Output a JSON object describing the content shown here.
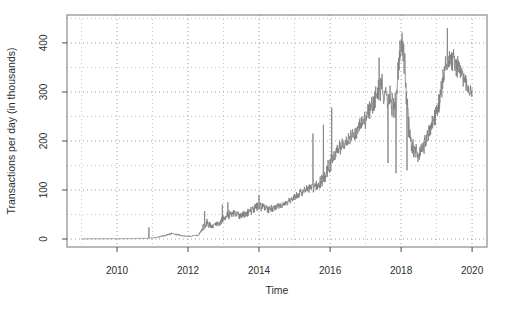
{
  "figure": {
    "background": "#ffffff"
  },
  "chart_data": {
    "type": "line",
    "title": "",
    "xlabel": "Time",
    "ylabel": "Transactions per day (in thousands)",
    "grid": true,
    "grid_style": "dotted",
    "legend": false,
    "xlim": [
      2008.592,
      2020.42
    ],
    "ylim": [
      -16.3,
      457
    ],
    "x_ticks": [
      2010,
      2012,
      2014,
      2016,
      2018,
      2020
    ],
    "y_ticks": [
      0,
      100,
      200,
      300,
      400
    ],
    "x_gridlines": [
      2009,
      2010,
      2011,
      2012,
      2013,
      2014,
      2015,
      2016,
      2017,
      2018,
      2019,
      2020
    ],
    "y_gridlines": [
      0,
      50,
      100,
      150,
      200,
      250,
      300,
      350,
      400,
      450
    ],
    "colors": {
      "series_line": "#7d7d7d",
      "plot_box": "#8a8a8a",
      "grid_major": "#9e9e9e",
      "grid_minor": "#c6c6c6",
      "tick": "#4a4a4a",
      "text": "#2e2e2e",
      "background": "#ffffff"
    },
    "series": [
      {
        "name": "transactions-per-day",
        "color": "#7d7d7d",
        "unit": "thousands of transactions per day",
        "x_start": 2009.0,
        "x_end": 2020.0,
        "trend": [
          [
            2009.0,
            0.3,
            0.2
          ],
          [
            2009.5,
            0.5,
            0.25
          ],
          [
            2010.0,
            0.6,
            0.3
          ],
          [
            2010.5,
            0.9,
            0.4
          ],
          [
            2010.88,
            1.6,
            0.7
          ],
          [
            2011.1,
            3.0,
            1.0
          ],
          [
            2011.35,
            7.0,
            2.0
          ],
          [
            2011.55,
            11.0,
            2.5
          ],
          [
            2011.8,
            7.0,
            1.8
          ],
          [
            2012.0,
            5.0,
            1.2
          ],
          [
            2012.3,
            7.5,
            1.8
          ],
          [
            2012.4,
            24.0,
            8.0
          ],
          [
            2012.55,
            33.0,
            9.0
          ],
          [
            2012.7,
            27.0,
            6.0
          ],
          [
            2012.9,
            33.0,
            7.0
          ],
          [
            2013.1,
            48.0,
            10.0
          ],
          [
            2013.3,
            52.0,
            9.0
          ],
          [
            2013.5,
            48.0,
            8.0
          ],
          [
            2013.75,
            57.0,
            9.0
          ],
          [
            2014.0,
            68.0,
            10.0
          ],
          [
            2014.25,
            60.0,
            8.0
          ],
          [
            2014.5,
            65.0,
            7.0
          ],
          [
            2014.75,
            74.0,
            7.0
          ],
          [
            2015.0,
            84.0,
            8.0
          ],
          [
            2015.25,
            98.0,
            9.0
          ],
          [
            2015.5,
            105.0,
            11.0
          ],
          [
            2015.75,
            118.0,
            13.0
          ],
          [
            2016.0,
            150.0,
            20.0
          ],
          [
            2016.25,
            185.0,
            16.0
          ],
          [
            2016.5,
            205.0,
            15.0
          ],
          [
            2016.75,
            220.0,
            16.0
          ],
          [
            2017.0,
            245.0,
            20.0
          ],
          [
            2017.25,
            285.0,
            24.0
          ],
          [
            2017.45,
            310.0,
            28.0
          ],
          [
            2017.65,
            290.0,
            30.0
          ],
          [
            2017.85,
            268.0,
            38.0
          ],
          [
            2017.97,
            380.0,
            45.0
          ],
          [
            2018.02,
            400.0,
            50.0
          ],
          [
            2018.08,
            385.0,
            45.0
          ],
          [
            2018.18,
            255.0,
            35.0
          ],
          [
            2018.32,
            185.0,
            20.0
          ],
          [
            2018.5,
            170.0,
            15.0
          ],
          [
            2018.7,
            198.0,
            18.0
          ],
          [
            2018.9,
            238.0,
            20.0
          ],
          [
            2019.05,
            272.0,
            22.0
          ],
          [
            2019.2,
            335.0,
            26.0
          ],
          [
            2019.35,
            368.0,
            26.0
          ],
          [
            2019.5,
            362.0,
            24.0
          ],
          [
            2019.65,
            345.0,
            23.0
          ],
          [
            2019.8,
            318.0,
            19.0
          ],
          [
            2019.95,
            300.0,
            15.0
          ],
          [
            2020.0,
            297.0,
            12.0
          ]
        ],
        "spikes": [
          [
            2010.9,
            24
          ],
          [
            2012.47,
            57
          ],
          [
            2012.97,
            70
          ],
          [
            2013.12,
            75
          ],
          [
            2014.0,
            90
          ],
          [
            2015.52,
            215
          ],
          [
            2015.81,
            233
          ],
          [
            2016.05,
            268
          ],
          [
            2017.38,
            370
          ],
          [
            2017.63,
            155
          ],
          [
            2017.86,
            134
          ],
          [
            2018.17,
            140
          ],
          [
            2019.3,
            430
          ]
        ]
      }
    ]
  }
}
